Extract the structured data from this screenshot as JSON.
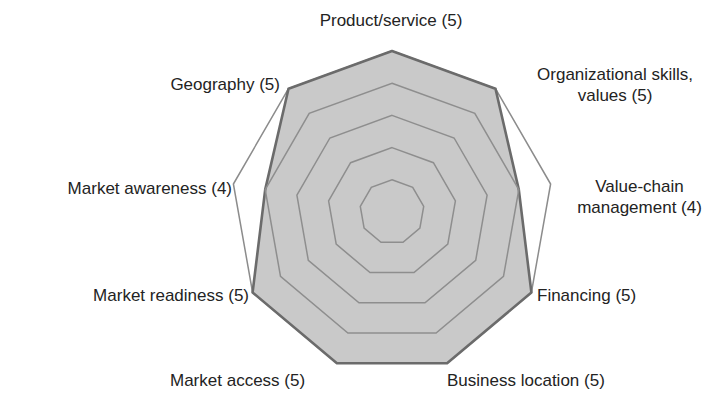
{
  "chart_data": {
    "type": "radar",
    "title": "",
    "categories": [
      "Product/service",
      "Organizational skills, values",
      "Value-chain management",
      "Financing",
      "Business location",
      "Market access",
      "Market readiness",
      "Market awareness",
      "Geography"
    ],
    "series": [
      {
        "name": "Score",
        "values": [
          5,
          5,
          4,
          5,
          5,
          5,
          5,
          4,
          5
        ],
        "fill": "#c9c9c9",
        "stroke": "#6b6b6b"
      },
      {
        "name": "Maximum",
        "values": [
          5,
          5,
          5,
          5,
          5,
          5,
          5,
          5,
          5
        ],
        "fill": "none",
        "stroke": "#8c8c8c"
      }
    ],
    "rlim": [
      0,
      5
    ],
    "grid_rings": [
      1,
      2,
      3,
      4
    ],
    "legend": "none"
  },
  "labels": [
    {
      "lines": [
        "Product/service (5)"
      ]
    },
    {
      "lines": [
        "Organizational skills,",
        "values (5)"
      ]
    },
    {
      "lines": [
        "Value-chain",
        "management (4)"
      ]
    },
    {
      "lines": [
        "Financing (5)"
      ]
    },
    {
      "lines": [
        "Business location (5)"
      ]
    },
    {
      "lines": [
        "Market access (5)"
      ]
    },
    {
      "lines": [
        "Market readiness (5)"
      ]
    },
    {
      "lines": [
        "Market awareness (4)"
      ]
    },
    {
      "lines": [
        "Geography (5)"
      ]
    }
  ],
  "colors": {
    "grid": "#8e8e8e",
    "text": "#232323"
  }
}
